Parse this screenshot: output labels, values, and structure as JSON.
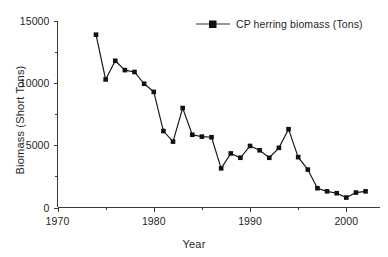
{
  "chart_data": {
    "type": "line",
    "title": "",
    "subtitle": "",
    "xlabel": "Year",
    "ylabel": "Biomass (Short Tons)",
    "xlim": [
      1970,
      2003.5
    ],
    "ylim": [
      0,
      15000
    ],
    "grid": false,
    "legend_position": "top-right",
    "x_ticks_major": [
      1970,
      1980,
      1990,
      2000
    ],
    "x_tick_labels": [
      "1970",
      "1980",
      "1990",
      "2000"
    ],
    "x_ticks_minor": [
      1975,
      1985,
      1995
    ],
    "y_ticks_major": [
      0,
      5000,
      10000,
      15000
    ],
    "y_tick_labels": [
      "0",
      "5000",
      "10000",
      "15000"
    ],
    "y_ticks_minor": [
      2500,
      7500,
      12500
    ],
    "marker": "square",
    "series": [
      {
        "name": "CP herring biomass (Tons)",
        "color": "#111111",
        "x": [
          1974,
          1975,
          1976,
          1977,
          1978,
          1979,
          1980,
          1981,
          1982,
          1983,
          1984,
          1985,
          1986,
          1987,
          1988,
          1989,
          1990,
          1991,
          1992,
          1993,
          1994,
          1995,
          1996,
          1997,
          1998,
          1999,
          2000,
          2001,
          2002
        ],
        "values": [
          13900,
          10300,
          11800,
          11050,
          10900,
          9950,
          9300,
          6150,
          5300,
          8000,
          5850,
          5700,
          5650,
          3150,
          4350,
          4000,
          4950,
          4600,
          4000,
          4800,
          6300,
          4050,
          3050,
          1550,
          1300,
          1150,
          800,
          1200,
          1300
        ]
      }
    ]
  },
  "legend": {
    "entries": [
      {
        "label": "CP herring biomass (Tons)",
        "marker": "square",
        "color": "#111111"
      }
    ]
  },
  "axes": {
    "y_title": "Biomass (Short Tons)",
    "x_title": "Year"
  },
  "colors": {
    "background": "#ffffff",
    "axis": "#3a3a3a",
    "series": "#111111",
    "text": "#1f1f1f"
  }
}
